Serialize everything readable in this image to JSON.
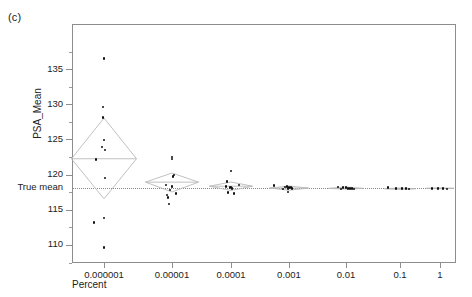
{
  "figure": {
    "panel_label": "(c)",
    "true_mean_label": "True mean",
    "colors": {
      "axis": "#8d8d8d",
      "point": "#111111",
      "diamond": "#b9b9b9",
      "reference_line": "#8a8a8a"
    }
  },
  "chart_data": {
    "type": "scatter",
    "title": "",
    "subtitle": "",
    "xlabel": "Percent",
    "ylabel": "PSA_Mean",
    "xscale": "log",
    "x_tick_labels": [
      "0.000001",
      "0.00001",
      "0.0001",
      "0.001",
      "0.01",
      "0.1",
      "1"
    ],
    "x_categories": [
      1e-06,
      1e-05,
      0.0001,
      0.001,
      0.01,
      0.1,
      1
    ],
    "y_tick_labels": [
      "135",
      "130",
      "125",
      "120",
      "115",
      "110"
    ],
    "y_ticks": [
      135,
      130,
      125,
      120,
      115,
      110
    ],
    "ylim": [
      107.5,
      141.5
    ],
    "y_minor_tick_step": 2.5,
    "grid": false,
    "legend": false,
    "annotations": [
      {
        "name": "true-mean",
        "label": "True mean",
        "y": 118.1,
        "style": "dotted-horizontal-line"
      },
      {
        "name": "panel-label",
        "label": "(c)"
      }
    ],
    "group_summaries": [
      {
        "x": 1e-06,
        "mean": 122.3,
        "ci_low": 116.6,
        "ci_high": 128.1,
        "marker": "diamond",
        "half_width_px": 33
      },
      {
        "x": 1e-05,
        "mean": 119.0,
        "ci_low": 117.6,
        "ci_high": 120.3,
        "marker": "diamond",
        "half_width_px": 27
      },
      {
        "x": 0.0001,
        "mean": 118.4,
        "ci_low": 117.8,
        "ci_high": 119.0,
        "marker": "diamond",
        "half_width_px": 22
      },
      {
        "x": 0.001,
        "mean": 118.2,
        "ci_low": 117.9,
        "ci_high": 118.5,
        "marker": "diamond",
        "half_width_px": 20
      },
      {
        "x": 0.01,
        "mean": 118.1,
        "ci_low": 118.0,
        "ci_high": 118.3,
        "marker": "diamond",
        "half_width_px": 18
      },
      {
        "x": 0.1,
        "mean": 118.1,
        "ci_low": 118.0,
        "ci_high": 118.2,
        "marker": "diamond",
        "half_width_px": 16
      },
      {
        "x": 1,
        "mean": 118.1,
        "ci_low": 118.05,
        "ci_high": 118.15,
        "marker": "diamond",
        "half_width_px": 14
      }
    ],
    "series": [
      {
        "name": "0.000001",
        "x": 1e-06,
        "values": [
          136.6,
          129.7,
          128.2,
          125.0,
          124.0,
          123.6,
          122.2,
          119.6,
          113.9,
          113.3,
          109.7
        ]
      },
      {
        "name": "0.00001",
        "x": 1e-05,
        "values": [
          122.6,
          122.3,
          120.0,
          119.8,
          118.6,
          118.4,
          117.9,
          117.4,
          117.2,
          116.8,
          115.9
        ]
      },
      {
        "name": "0.0001",
        "x": 0.0001,
        "values": [
          120.6,
          119.1,
          118.6,
          118.4,
          118.3,
          118.2,
          118.1,
          117.5,
          117.4
        ]
      },
      {
        "name": "0.001",
        "x": 0.001,
        "values": [
          118.5,
          118.4,
          118.3,
          118.2,
          118.2,
          118.1,
          118.1,
          118.0,
          117.6
        ]
      },
      {
        "name": "0.01",
        "x": 0.01,
        "values": [
          118.3,
          118.2,
          118.2,
          118.1,
          118.1,
          118.1,
          118.0,
          118.0
        ]
      },
      {
        "name": "0.1",
        "x": 0.1,
        "values": [
          118.2,
          118.1,
          118.1,
          118.1,
          118.0
        ]
      },
      {
        "name": "1",
        "x": 1,
        "values": [
          118.1,
          118.1,
          118.1,
          118.0
        ]
      }
    ],
    "point_layout": {
      "comment": "jittered pixel offsets within each group, as rendered",
      "groups": [
        {
          "x": 1e-06,
          "center_px": 104,
          "points": [
            [
              0,
              136.6
            ],
            [
              -1,
              129.7
            ],
            [
              -1,
              128.2
            ],
            [
              0,
              125.0
            ],
            [
              -2,
              124.0
            ],
            [
              1,
              123.6
            ],
            [
              -8,
              122.2
            ],
            [
              1,
              119.6
            ],
            [
              0,
              113.9
            ],
            [
              -10,
              113.3
            ],
            [
              0,
              109.7
            ]
          ]
        },
        {
          "x": 1e-05,
          "center_px": 172,
          "points": [
            [
              0,
              122.6
            ],
            [
              0,
              122.3
            ],
            [
              2,
              120.0
            ],
            [
              1,
              119.8
            ],
            [
              -6,
              118.6
            ],
            [
              0,
              118.4
            ],
            [
              -2,
              117.9
            ],
            [
              4,
              117.4
            ],
            [
              -5,
              117.2
            ],
            [
              -4,
              116.8
            ],
            [
              -3,
              115.9
            ]
          ]
        },
        {
          "x": 0.0001,
          "center_px": 231,
          "points": [
            [
              0,
              120.6
            ],
            [
              -4,
              119.1
            ],
            [
              8,
              118.6
            ],
            [
              -5,
              118.4
            ],
            [
              0,
              118.3
            ],
            [
              -1,
              118.2
            ],
            [
              1,
              118.1
            ],
            [
              -3,
              117.5
            ],
            [
              3,
              117.4
            ]
          ]
        },
        {
          "x": 0.001,
          "center_px": 289,
          "points": [
            [
              -15,
              118.5
            ],
            [
              -2,
              118.4
            ],
            [
              -4,
              118.3
            ],
            [
              0,
              118.2
            ],
            [
              2,
              118.2
            ],
            [
              -1,
              118.1
            ],
            [
              3,
              118.1
            ],
            [
              -6,
              118.0
            ],
            [
              -1,
              117.6
            ]
          ]
        },
        {
          "x": 0.01,
          "center_px": 346,
          "points": [
            [
              -8,
              118.3
            ],
            [
              -3,
              118.2
            ],
            [
              0,
              118.2
            ],
            [
              2,
              118.1
            ],
            [
              4,
              118.1
            ],
            [
              6,
              118.1
            ],
            [
              -5,
              118.0
            ],
            [
              8,
              118.0
            ]
          ]
        },
        {
          "x": 0.1,
          "center_px": 400,
          "points": [
            [
              -12,
              118.2
            ],
            [
              -4,
              118.1
            ],
            [
              2,
              118.1
            ],
            [
              6,
              118.1
            ],
            [
              9,
              118.0
            ]
          ]
        },
        {
          "x": 1,
          "center_px": 440,
          "points": [
            [
              -8,
              118.1
            ],
            [
              -2,
              118.1
            ],
            [
              3,
              118.1
            ],
            [
              7,
              118.0
            ]
          ]
        }
      ]
    }
  }
}
